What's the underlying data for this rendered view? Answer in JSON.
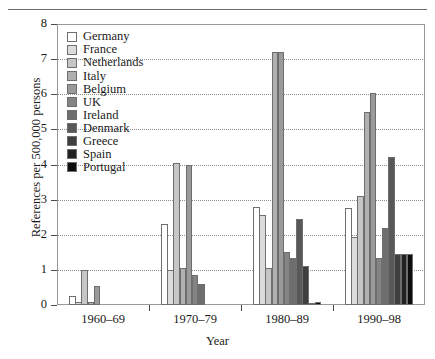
{
  "chart_data": {
    "type": "bar",
    "title": "",
    "xlabel": "Year",
    "ylabel": "References per 500,000 persons",
    "categories": [
      "1960–69",
      "1970–79",
      "1980–89",
      "1990–98"
    ],
    "ylim": [
      0,
      8
    ],
    "yticks": [
      0,
      1,
      2,
      3,
      4,
      5,
      6,
      7,
      8
    ],
    "grid": true,
    "legend_position": "upper-left-inside",
    "series": [
      {
        "name": "Germany",
        "color": "#ffffff",
        "values": [
          0.25,
          2.3,
          2.8,
          2.75
        ]
      },
      {
        "name": "France",
        "color": "#dcdcdc",
        "values": [
          0.1,
          1.0,
          2.55,
          1.95
        ]
      },
      {
        "name": "Netherlands",
        "color": "#c6c6c6",
        "values": [
          1.0,
          4.05,
          1.05,
          3.1
        ]
      },
      {
        "name": "Italy",
        "color": "#b0b0b0",
        "values": [
          0.1,
          1.05,
          7.2,
          5.5
        ]
      },
      {
        "name": "Belgium",
        "color": "#9a9a9a",
        "values": [
          0.55,
          4.0,
          7.2,
          6.05
        ]
      },
      {
        "name": "UK",
        "color": "#848484",
        "values": [
          0.0,
          0.85,
          1.5,
          1.35
        ]
      },
      {
        "name": "Ireland",
        "color": "#6e6e6e",
        "values": [
          0.0,
          0.6,
          1.35,
          2.2
        ]
      },
      {
        "name": "Denmark",
        "color": "#585858",
        "values": [
          0.0,
          0.0,
          2.45,
          4.2
        ]
      },
      {
        "name": "Greece",
        "color": "#3f3f3f",
        "values": [
          0.0,
          0.0,
          1.1,
          1.45
        ]
      },
      {
        "name": "Spain",
        "color": "#222222",
        "values": [
          0.0,
          0.0,
          0.02,
          1.45
        ]
      },
      {
        "name": "Portugal",
        "color": "#0d0d0d",
        "values": [
          0.0,
          0.0,
          0.1,
          1.45
        ]
      }
    ]
  },
  "axis": {
    "y_tick_labels": [
      "0",
      "1",
      "2",
      "3",
      "4",
      "5",
      "6",
      "7",
      "8"
    ],
    "y_title": "References per 500,000 persons",
    "x_title": "Year",
    "x_tick_labels": [
      "1960–69",
      "1970–79",
      "1980–89",
      "1990–98"
    ]
  }
}
